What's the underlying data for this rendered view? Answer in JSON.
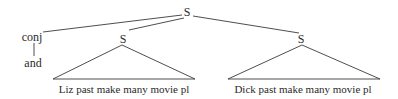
{
  "tree": {
    "root": {
      "label": "S"
    },
    "conj": {
      "label": "conj",
      "child": "and"
    },
    "left_clause": {
      "label": "S",
      "terminal": "Liz past make many movie pl"
    },
    "right_clause": {
      "label": "S",
      "terminal": "Dick past make many movie pl"
    }
  }
}
